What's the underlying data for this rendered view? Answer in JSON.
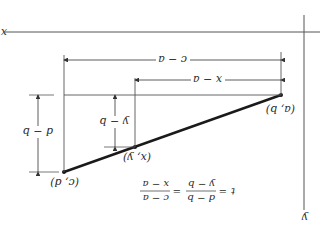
{
  "orientation": "rotated-180",
  "colors": {
    "ink": "#2a2a2a",
    "line": "#555555",
    "segment": "#1a1a1a",
    "background": "#ffffff"
  },
  "axes": {
    "x_label": "x",
    "y_label": "y"
  },
  "points": {
    "p1": {
      "label": "(a, b)"
    },
    "p2": {
      "label": "(x, y)"
    },
    "p3": {
      "label": "(c, d)"
    }
  },
  "dimensions": {
    "horizontal_full": "c − a",
    "horizontal_partial": "x − a",
    "vertical_full": "d − b",
    "vertical_partial": "y − b"
  },
  "equation": {
    "lhs": "t",
    "eq": "=",
    "frac1_num": "d − b",
    "frac1_den": "y − b",
    "eq2": "=",
    "frac2_num": "c − a",
    "frac2_den": "x − a"
  }
}
